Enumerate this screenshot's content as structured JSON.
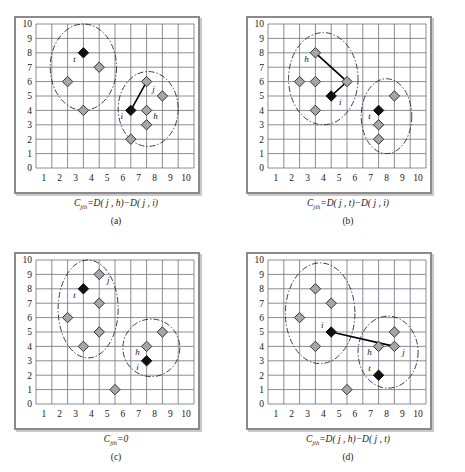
{
  "figure": {
    "width": 465,
    "height": 472,
    "background": "#ffffff"
  },
  "style": {
    "grid_line_color": "#6e6e82",
    "frame_color": "#8a8a8a",
    "shadow_color": "#c9c9c9",
    "diamond_fill": "#a6a6a6",
    "diamond_stroke": "#333333",
    "highlight_fill": "#111111",
    "ellipse_color": "#2b2b2b",
    "connector_color": "#000000",
    "axis_text_color": "#1a1a1a"
  },
  "axes": {
    "x_ticks": [
      "1",
      "2",
      "3",
      "4",
      "5",
      "6",
      "7",
      "8",
      "9",
      "10"
    ],
    "y_ticks": [
      "0",
      "1",
      "2",
      "3",
      "4",
      "5",
      "6",
      "7",
      "8",
      "9",
      "10"
    ],
    "xlim": [
      0,
      10
    ],
    "ylim": [
      0,
      10
    ]
  },
  "chart_data": {
    "type": "scatter",
    "title": "",
    "xlabel": "",
    "ylabel": "",
    "xlim": [
      0,
      10
    ],
    "ylim": [
      0,
      10
    ],
    "grid": true,
    "legend": "none",
    "panels": [
      {
        "id": "a",
        "letter": "(a)",
        "formula": "C_jih = D(j,h) - D(j,i)",
        "formula_parts": {
          "c": "C",
          "subscript": "jih",
          "rest": "=D( j , h)−D( j , i)"
        },
        "points": [
          {
            "x": 3,
            "y": 8,
            "kind": "highlight",
            "label": "t",
            "label_pos": "left-below"
          },
          {
            "x": 4,
            "y": 7,
            "kind": "normal",
            "label": "",
            "label_pos": ""
          },
          {
            "x": 2,
            "y": 6,
            "kind": "normal",
            "label": "",
            "label_pos": ""
          },
          {
            "x": 3,
            "y": 4,
            "kind": "normal",
            "label": "",
            "label_pos": ""
          },
          {
            "x": 7,
            "y": 6,
            "kind": "normal",
            "label": "",
            "label_pos": ""
          },
          {
            "x": 8,
            "y": 5,
            "kind": "normal",
            "label": "j",
            "label_pos": "left-above"
          },
          {
            "x": 6,
            "y": 4,
            "kind": "highlight",
            "label": "i",
            "label_pos": "left-below"
          },
          {
            "x": 7,
            "y": 4,
            "kind": "normal",
            "label": "h",
            "label_pos": "right-below"
          },
          {
            "x": 7,
            "y": 3,
            "kind": "normal",
            "label": "",
            "label_pos": ""
          },
          {
            "x": 6,
            "y": 2,
            "kind": "normal",
            "label": "",
            "label_pos": ""
          }
        ],
        "connector": {
          "from": [
            7,
            6
          ],
          "to": [
            6,
            4
          ]
        },
        "clusters": [
          {
            "cx": 3.0,
            "cy": 7.0,
            "rx": 2.1,
            "ry": 3.0,
            "rotate": 0
          },
          {
            "cx": 7.1,
            "cy": 4.1,
            "rx": 1.9,
            "ry": 2.6,
            "rotate": 0
          }
        ]
      },
      {
        "id": "b",
        "letter": "(b)",
        "formula": "C_jih = D(j,t) - D(j,i)",
        "formula_parts": {
          "c": "C",
          "subscript": "jih",
          "rest": "=D( j , t)−D( j , i)"
        },
        "points": [
          {
            "x": 3,
            "y": 8,
            "kind": "normal",
            "label": "h",
            "label_pos": "left-below"
          },
          {
            "x": 2,
            "y": 6,
            "kind": "normal",
            "label": "",
            "label_pos": ""
          },
          {
            "x": 3,
            "y": 6,
            "kind": "normal",
            "label": "",
            "label_pos": ""
          },
          {
            "x": 5,
            "y": 6,
            "kind": "normal",
            "label": "",
            "label_pos": ""
          },
          {
            "x": 3,
            "y": 4,
            "kind": "normal",
            "label": "",
            "label_pos": ""
          },
          {
            "x": 4,
            "y": 5,
            "kind": "highlight",
            "label": "i",
            "label_pos": "right-below"
          },
          {
            "x": 8,
            "y": 5,
            "kind": "normal",
            "label": "",
            "label_pos": ""
          },
          {
            "x": 7,
            "y": 4,
            "kind": "highlight",
            "label": "t",
            "label_pos": "left-below"
          },
          {
            "x": 7,
            "y": 3,
            "kind": "normal",
            "label": "",
            "label_pos": ""
          },
          {
            "x": 7,
            "y": 2,
            "kind": "normal",
            "label": "",
            "label_pos": ""
          }
        ],
        "connector_path": [
          [
            3,
            8
          ],
          [
            5,
            6
          ],
          [
            4,
            5
          ]
        ],
        "clusters": [
          {
            "cx": 3.5,
            "cy": 6.2,
            "rx": 2.2,
            "ry": 3.2,
            "rotate": 0
          },
          {
            "cx": 7.5,
            "cy": 3.6,
            "rx": 1.6,
            "ry": 2.6,
            "rotate": 0
          }
        ]
      },
      {
        "id": "c",
        "letter": "(c)",
        "formula": "C_jih = 0",
        "formula_parts": {
          "c": "C",
          "subscript": "jih",
          "rest": "=0"
        },
        "points": [
          {
            "x": 4,
            "y": 9,
            "kind": "normal",
            "label": "j",
            "label_pos": "right-below"
          },
          {
            "x": 3,
            "y": 8,
            "kind": "highlight",
            "label": "t",
            "label_pos": "left-below"
          },
          {
            "x": 4,
            "y": 7,
            "kind": "normal",
            "label": "",
            "label_pos": ""
          },
          {
            "x": 2,
            "y": 6,
            "kind": "normal",
            "label": "",
            "label_pos": ""
          },
          {
            "x": 4,
            "y": 5,
            "kind": "normal",
            "label": "",
            "label_pos": ""
          },
          {
            "x": 3,
            "y": 4,
            "kind": "normal",
            "label": "",
            "label_pos": ""
          },
          {
            "x": 5,
            "y": 1,
            "kind": "normal",
            "label": "",
            "label_pos": ""
          },
          {
            "x": 8,
            "y": 5,
            "kind": "normal",
            "label": "",
            "label_pos": ""
          },
          {
            "x": 7,
            "y": 4,
            "kind": "normal",
            "label": "h",
            "label_pos": "left-below"
          },
          {
            "x": 7,
            "y": 3,
            "kind": "highlight",
            "label": "i",
            "label_pos": "left-below"
          }
        ],
        "connector": null,
        "clusters": [
          {
            "cx": 3.3,
            "cy": 6.6,
            "rx": 1.9,
            "ry": 3.4,
            "rotate": 0
          },
          {
            "cx": 7.3,
            "cy": 3.9,
            "rx": 1.8,
            "ry": 2.0,
            "rotate": 0
          }
        ]
      },
      {
        "id": "d",
        "letter": "(d)",
        "formula": "C_jih = D(j,h) - D(j,t)",
        "formula_parts": {
          "c": "C",
          "subscript": "jih",
          "rest": "=D( j , h)−D( j , t)"
        },
        "points": [
          {
            "x": 3,
            "y": 8,
            "kind": "normal",
            "label": "",
            "label_pos": ""
          },
          {
            "x": 4,
            "y": 7,
            "kind": "normal",
            "label": "",
            "label_pos": ""
          },
          {
            "x": 2,
            "y": 6,
            "kind": "normal",
            "label": "",
            "label_pos": ""
          },
          {
            "x": 4,
            "y": 5,
            "kind": "highlight",
            "label": "i",
            "label_pos": "left-above"
          },
          {
            "x": 3,
            "y": 4,
            "kind": "normal",
            "label": "",
            "label_pos": ""
          },
          {
            "x": 5,
            "y": 1,
            "kind": "normal",
            "label": "",
            "label_pos": ""
          },
          {
            "x": 8,
            "y": 5,
            "kind": "normal",
            "label": "",
            "label_pos": ""
          },
          {
            "x": 7,
            "y": 4,
            "kind": "normal",
            "label": "h",
            "label_pos": "left-below"
          },
          {
            "x": 8,
            "y": 4,
            "kind": "normal",
            "label": "j",
            "label_pos": "right-below"
          },
          {
            "x": 7,
            "y": 2,
            "kind": "highlight",
            "label": "t",
            "label_pos": "left-above"
          }
        ],
        "connector": {
          "from": [
            4,
            5
          ],
          "to": [
            8,
            4
          ]
        },
        "clusters": [
          {
            "cx": 3.3,
            "cy": 6.3,
            "rx": 2.2,
            "ry": 3.5,
            "rotate": 0
          },
          {
            "cx": 7.6,
            "cy": 3.6,
            "rx": 1.9,
            "ry": 2.5,
            "rotate": 0
          }
        ]
      }
    ]
  }
}
